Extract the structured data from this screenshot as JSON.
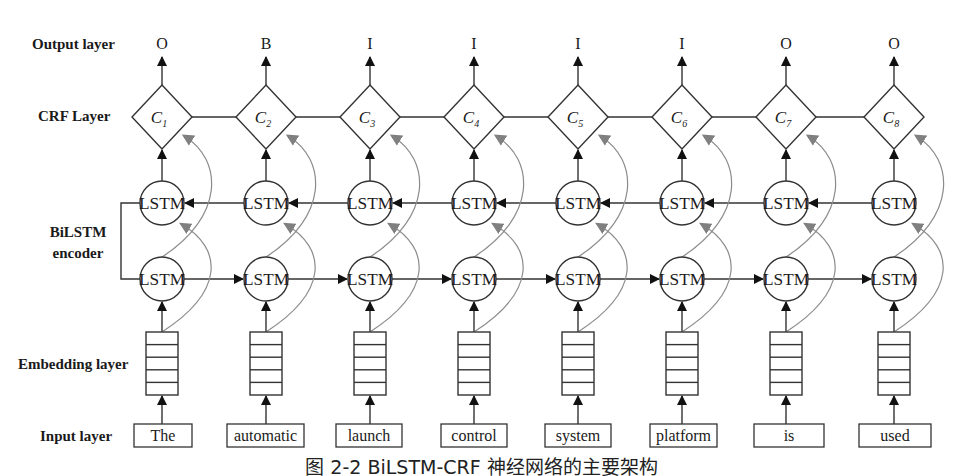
{
  "layer_labels": {
    "output": "Output layer",
    "crf": "CRF Layer",
    "bilstm_line1": "BiLSTM",
    "bilstm_line2": "encoder",
    "embedding": "Embedding layer",
    "input": "Input layer"
  },
  "lstm_label": "LSTM",
  "caption": "图 2-2 BiLSTM-CRF 神经网络的主要架构",
  "colors": {
    "stroke": "#333333",
    "arrow": "#111111",
    "curve": "#8c8c8c",
    "curve_head": "#808080",
    "text": "#1a1a1a"
  },
  "columns": [
    {
      "x": 162,
      "input": "The",
      "input_box": [
        134,
        192
      ],
      "output": "O",
      "crf": "C",
      "crf_sub": "1"
    },
    {
      "x": 266,
      "input": "automatic",
      "input_box": [
        227,
        304
      ],
      "output": "B",
      "crf": "C",
      "crf_sub": "2"
    },
    {
      "x": 370,
      "input": "launch",
      "input_box": [
        336,
        402
      ],
      "output": "I",
      "crf": "C",
      "crf_sub": "3"
    },
    {
      "x": 474,
      "input": "control",
      "input_box": [
        441,
        507
      ],
      "output": "I",
      "crf": "C",
      "crf_sub": "4"
    },
    {
      "x": 578,
      "input": "system",
      "input_box": [
        545,
        611
      ],
      "output": "I",
      "crf": "C",
      "crf_sub": "5"
    },
    {
      "x": 682,
      "input": "platform",
      "input_box": [
        650,
        717
      ],
      "output": "I",
      "crf": "C",
      "crf_sub": "6"
    },
    {
      "x": 786,
      "input": "is",
      "input_box": [
        754,
        824
      ],
      "output": "O",
      "crf": "C",
      "crf_sub": "7"
    },
    {
      "x": 894,
      "input": "used",
      "input_box": [
        859,
        931
      ],
      "output": "O",
      "crf": "C",
      "crf_sub": "8"
    }
  ],
  "geometry": {
    "output_y": 44,
    "crf_cy": 117,
    "crf_half_w": 30,
    "crf_half_h": 32,
    "lstm_upper_cy": 203,
    "lstm_lower_cy": 279,
    "lstm_r": 22,
    "embed_top": 332,
    "embed_bottom": 395,
    "embed_half_w": 16,
    "embed_rows": 5,
    "input_top": 424,
    "input_bottom": 447,
    "bracket_x": 121
  }
}
